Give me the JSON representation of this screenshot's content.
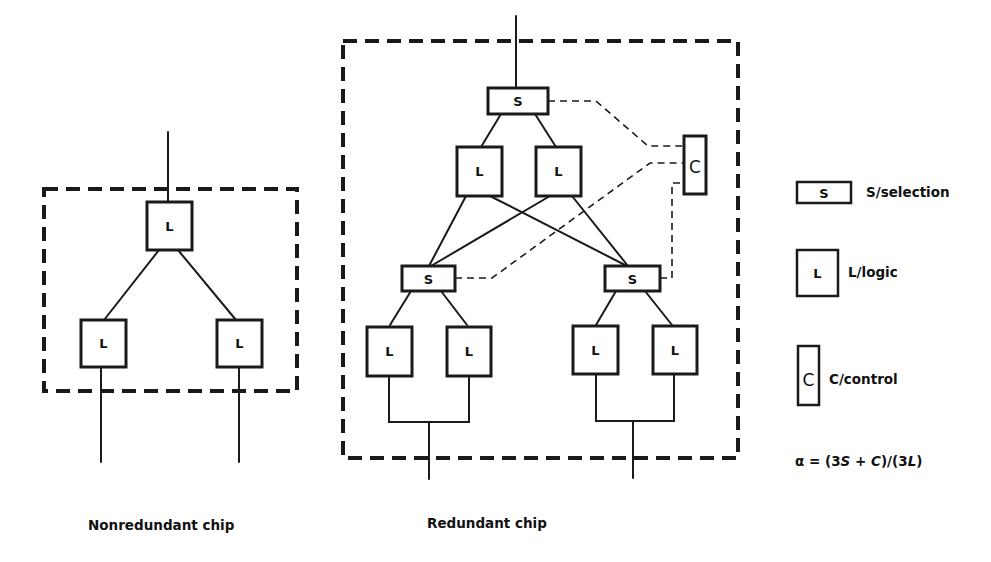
{
  "diagram": {
    "nonredundant": {
      "caption": "Nonredundant chip",
      "top_block_label": "L",
      "left_block_label": "L",
      "right_block_label": "L"
    },
    "redundant": {
      "caption": "Redundant chip",
      "top_selector_label": "S",
      "upper_left_logic_label": "L",
      "upper_right_logic_label": "L",
      "control_label": "C",
      "left_selector_label": "S",
      "right_selector_label": "S",
      "lower_logic_labels": [
        "L",
        "L",
        "L",
        "L"
      ]
    },
    "legend": {
      "items": [
        {
          "symbol": "S",
          "text": "S/selection"
        },
        {
          "symbol": "L",
          "text": "L/logic"
        },
        {
          "symbol": "C",
          "text": "C/control"
        }
      ],
      "formula": {
        "lhs": "α = ",
        "text": "α = (3S + C)/(3L)",
        "num_open": "(3",
        "s": "S",
        "plus": " + ",
        "c": "C",
        "mid": ")/(3",
        "l": "L",
        "close": ")"
      }
    }
  }
}
